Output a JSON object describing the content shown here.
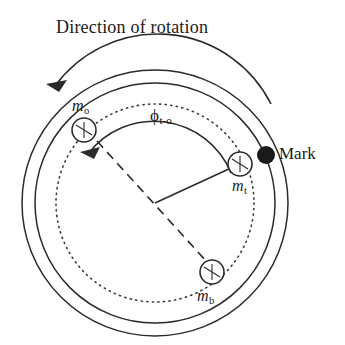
{
  "figure": {
    "title": "Direction of rotation",
    "background_color": "#ffffff",
    "stroke_color": "#2b2b2b",
    "mark_color": "#1a1a1a"
  },
  "labels": {
    "outer_mass": {
      "symbol": "m",
      "subscript": "o"
    },
    "top_mass": {
      "symbol": "m",
      "subscript": "t"
    },
    "bottom_mass": {
      "symbol": "m",
      "subscript": "b"
    },
    "angle": {
      "symbol": "ϕ",
      "subscript": "t-o"
    },
    "mark": "Mark"
  },
  "geometry": {
    "center": {
      "x": 155,
      "y": 203
    },
    "outer_ring_radius": 133,
    "inner_ring_radius": 122,
    "dotted_path_radius": 99,
    "mass_radius": 12,
    "mark_radius": 9,
    "radius_line_length": 88,
    "angle_arc_radius": 83,
    "masses": [
      {
        "name": "m_o",
        "angle_deg": 143,
        "x": 84,
        "y": 130
      },
      {
        "name": "m_t",
        "angle_deg": 23,
        "x": 240,
        "y": 164
      },
      {
        "name": "m_b",
        "angle_deg": -44,
        "x": 212,
        "y": 272
      }
    ],
    "mark": {
      "x": 266,
      "y": 155
    },
    "rotation_arrow": {
      "direction": "counterclockwise",
      "start": {
        "x": 262,
        "y": 87
      },
      "end": {
        "x": 49,
        "y": 85
      }
    }
  }
}
